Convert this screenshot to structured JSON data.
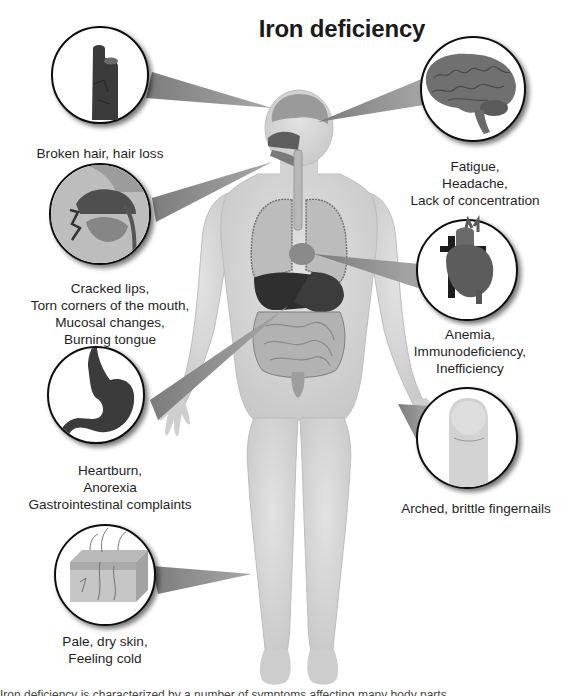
{
  "title": "Iron deficiency",
  "callouts": [
    {
      "id": "hair",
      "icon": "hair-strand-icon",
      "lines": [
        "Broken hair, hair loss"
      ]
    },
    {
      "id": "brain",
      "icon": "brain-icon",
      "lines": [
        "Fatigue,",
        "Headache,",
        "Lack of concentration"
      ]
    },
    {
      "id": "mouth",
      "icon": "mouth-cross-section-icon",
      "lines": [
        "Cracked lips,",
        "Torn corners of the mouth,",
        "Mucosal changes,",
        "Burning tongue"
      ]
    },
    {
      "id": "heart",
      "icon": "heart-icon",
      "lines": [
        "Anemia,",
        "Immunodeficiency,",
        "Inefficiency"
      ]
    },
    {
      "id": "stomach",
      "icon": "stomach-icon",
      "lines": [
        "Heartburn,",
        "Anorexia",
        "Gastrointestinal complaints"
      ]
    },
    {
      "id": "fingernail",
      "icon": "fingernail-icon",
      "lines": [
        "Arched, brittle fingernails"
      ]
    },
    {
      "id": "skin",
      "icon": "skin-layers-icon",
      "lines": [
        "Pale, dry skin,",
        "Feeling cold"
      ]
    }
  ],
  "footer_caption_clipped": "Iron deficiency is characterized by a number of symptoms affecting many body parts",
  "colors": {
    "background": "#ffffff",
    "body": "#d4d4d4",
    "body_outline": "#bdbdbd",
    "pointer": "#8f8f8f",
    "circle_border": "#111111",
    "text": "#1f1f1f"
  }
}
